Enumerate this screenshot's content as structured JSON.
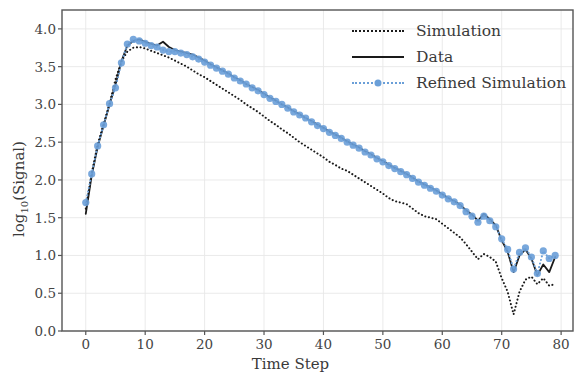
{
  "chart_data": {
    "type": "line",
    "title": "",
    "xlabel": "Time Step",
    "ylabel_main": "log",
    "ylabel_sub": "10",
    "ylabel_tail": "(Signal)",
    "xlim": [
      -4,
      82
    ],
    "ylim": [
      0.0,
      4.25
    ],
    "xticks": [
      0,
      10,
      20,
      30,
      40,
      50,
      60,
      70,
      80
    ],
    "xtick_labels": [
      "0",
      "10",
      "20",
      "30",
      "40",
      "50",
      "60",
      "70",
      "80"
    ],
    "yticks": [
      0.0,
      0.5,
      1.0,
      1.5,
      2.0,
      2.5,
      3.0,
      3.5,
      4.0
    ],
    "ytick_labels": [
      "0.0",
      "0.5",
      "1.0",
      "1.5",
      "2.0",
      "2.5",
      "3.0",
      "3.5",
      "4.0"
    ],
    "grid": true,
    "grid_color": "#e8e8e8",
    "frame": true,
    "legend_position": "upper right",
    "legend_entries": [
      {
        "label": "Simulation",
        "style": "dotted",
        "color": "#1a1a1a",
        "marker": "none"
      },
      {
        "label": "Data",
        "style": "solid",
        "color": "#1a1a1a",
        "marker": "none"
      },
      {
        "label": "Refined Simulation",
        "style": "dotted",
        "color": "#6a9fd8",
        "marker": "circle"
      }
    ],
    "x": [
      0,
      1,
      2,
      3,
      4,
      5,
      6,
      7,
      8,
      9,
      10,
      11,
      12,
      13,
      14,
      15,
      16,
      17,
      18,
      19,
      20,
      21,
      22,
      23,
      24,
      25,
      26,
      27,
      28,
      29,
      30,
      31,
      32,
      33,
      34,
      35,
      36,
      37,
      38,
      39,
      40,
      41,
      42,
      43,
      44,
      45,
      46,
      47,
      48,
      49,
      50,
      51,
      52,
      53,
      54,
      55,
      56,
      57,
      58,
      59,
      60,
      61,
      62,
      63,
      64,
      65,
      66,
      67,
      68,
      69,
      70,
      71,
      72,
      73,
      74,
      75,
      76,
      77,
      78,
      79
    ],
    "series": [
      {
        "name": "Simulation",
        "color": "#1a1a1a",
        "style": "dotted",
        "values": [
          1.62,
          2.09,
          2.47,
          2.74,
          3.01,
          3.33,
          3.57,
          3.7,
          3.75,
          3.76,
          3.74,
          3.71,
          3.68,
          3.65,
          3.62,
          3.58,
          3.54,
          3.5,
          3.45,
          3.4,
          3.36,
          3.31,
          3.26,
          3.21,
          3.16,
          3.11,
          3.06,
          3.0,
          2.95,
          2.9,
          2.84,
          2.78,
          2.73,
          2.67,
          2.62,
          2.56,
          2.5,
          2.45,
          2.4,
          2.35,
          2.3,
          2.24,
          2.2,
          2.15,
          2.12,
          2.07,
          2.02,
          1.97,
          1.92,
          1.87,
          1.82,
          1.76,
          1.72,
          1.7,
          1.68,
          1.62,
          1.56,
          1.52,
          1.5,
          1.48,
          1.42,
          1.36,
          1.3,
          1.24,
          1.15,
          1.05,
          0.95,
          1.02,
          0.98,
          0.92,
          0.7,
          0.52,
          0.22,
          0.52,
          0.68,
          0.72,
          0.62,
          0.7,
          0.6,
          0.62
        ]
      },
      {
        "name": "Data",
        "color": "#1a1a1a",
        "style": "solid",
        "values": [
          1.55,
          2.06,
          2.44,
          2.72,
          3.0,
          3.26,
          3.57,
          3.78,
          3.84,
          3.86,
          3.83,
          3.8,
          3.78,
          3.83,
          3.76,
          3.72,
          3.7,
          3.68,
          3.66,
          3.62,
          3.58,
          3.53,
          3.49,
          3.45,
          3.41,
          3.36,
          3.32,
          3.27,
          3.23,
          3.19,
          3.14,
          3.09,
          3.05,
          3.0,
          2.96,
          2.91,
          2.87,
          2.82,
          2.78,
          2.73,
          2.69,
          2.64,
          2.6,
          2.56,
          2.51,
          2.47,
          2.43,
          2.38,
          2.34,
          2.29,
          2.25,
          2.2,
          2.16,
          2.12,
          2.08,
          2.03,
          1.98,
          1.94,
          1.9,
          1.86,
          1.81,
          1.76,
          1.72,
          1.67,
          1.6,
          1.54,
          1.46,
          1.55,
          1.48,
          1.4,
          1.2,
          1.05,
          0.78,
          1.0,
          1.08,
          0.96,
          0.74,
          0.88,
          0.78,
          0.98
        ]
      },
      {
        "name": "Refined Simulation",
        "color": "#6a9fd8",
        "style": "dotted",
        "marker": "circle",
        "values": [
          1.7,
          2.08,
          2.45,
          2.73,
          3.01,
          3.22,
          3.55,
          3.8,
          3.86,
          3.84,
          3.81,
          3.78,
          3.76,
          3.72,
          3.7,
          3.7,
          3.68,
          3.66,
          3.63,
          3.6,
          3.56,
          3.52,
          3.48,
          3.44,
          3.4,
          3.35,
          3.31,
          3.27,
          3.22,
          3.18,
          3.13,
          3.08,
          3.04,
          3.0,
          2.95,
          2.9,
          2.86,
          2.82,
          2.77,
          2.72,
          2.68,
          2.63,
          2.59,
          2.55,
          2.5,
          2.46,
          2.42,
          2.37,
          2.33,
          2.28,
          2.24,
          2.19,
          2.15,
          2.11,
          2.07,
          2.02,
          1.97,
          1.93,
          1.89,
          1.85,
          1.8,
          1.75,
          1.71,
          1.66,
          1.58,
          1.52,
          1.44,
          1.52,
          1.46,
          1.38,
          1.22,
          1.08,
          0.82,
          1.04,
          1.1,
          0.98,
          0.76,
          1.06,
          0.96,
          1.0
        ]
      }
    ]
  }
}
